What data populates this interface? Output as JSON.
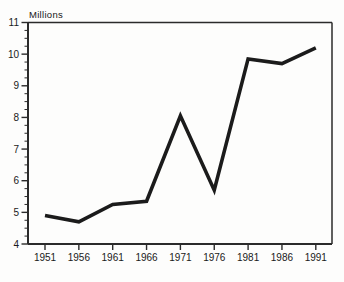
{
  "figure": {
    "background": "#fdfdfc"
  },
  "chart_data": {
    "type": "line",
    "title": "",
    "xlabel": "",
    "ylabel": "Millions",
    "categories": [
      "1951",
      "1956",
      "1961",
      "1966",
      "1971",
      "1976",
      "1981",
      "1986",
      "1991"
    ],
    "values": [
      4.9,
      4.7,
      5.25,
      5.35,
      8.05,
      5.7,
      9.85,
      9.7,
      10.2
    ],
    "ylim": [
      4,
      11
    ],
    "y_tick_labels": [
      "4",
      "5",
      "6",
      "7",
      "8",
      "9",
      "10",
      "11"
    ],
    "y_major_tick_step": 1,
    "y_minor_tick_step": 0.25,
    "grid": false,
    "legend_position": "none",
    "frame": true,
    "line_color": "#1b1b1b",
    "axis_color": "#2b2b2b",
    "tick_color": "#2b2b2b",
    "tick_label_color": "#1a1a1a"
  }
}
